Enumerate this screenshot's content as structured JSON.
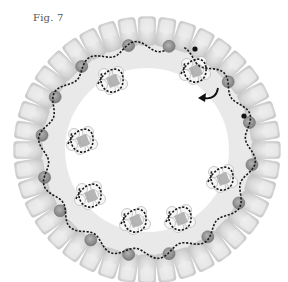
{
  "figure": {
    "label": "Fig. 7",
    "center": [
      147,
      150
    ],
    "ring": {
      "tile_count": 40,
      "outer_radius": 134,
      "inner_radius": 104,
      "tile_color": "#d6d6d6",
      "tile_highlight": "#ececec",
      "tile_stroke": "#c4c4c4",
      "inner_band_color": "#e9e9e9"
    },
    "beads": {
      "color": "#8c8c8c",
      "stroke": "#6f6f6f",
      "radius_px": 6,
      "angles_deg": [
        -100,
        -78,
        -128,
        -150,
        -172,
        165,
        145,
        122,
        100,
        78,
        55,
        30,
        8,
        -15,
        -40
      ]
    },
    "clusters": {
      "count": 7,
      "fill_color": "#a9a9a9",
      "outline_color": "#bdbdbd",
      "positions": [
        [
          112,
          80
        ],
        [
          195,
          70
        ],
        [
          82,
          140
        ],
        [
          222,
          178
        ],
        [
          90,
          195
        ],
        [
          180,
          218
        ],
        [
          135,
          220
        ]
      ]
    },
    "path": {
      "style": "dashed",
      "color": "#1a1a1a",
      "end_dots": [
        [
          195,
          49
        ],
        [
          244,
          116
        ]
      ]
    },
    "arrow": {
      "color": "#111111",
      "from": [
        218,
        88
      ],
      "to": [
        200,
        98
      ]
    }
  }
}
